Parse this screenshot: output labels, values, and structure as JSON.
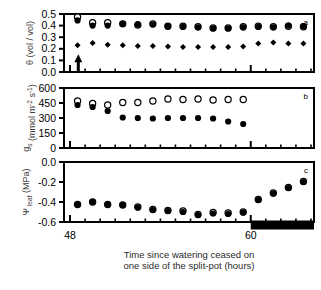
{
  "figure": {
    "panels": [
      "a",
      "b",
      "c"
    ],
    "x_axis": {
      "label_line1": "Time since watering ceased on",
      "label_line2": "one side of the split-pot (hours)",
      "ticks": [
        48,
        60
      ],
      "tick_labels": [
        "48",
        "60"
      ],
      "range": [
        47.6,
        64.2
      ],
      "minor_tick_step": 1
    }
  },
  "panel_a": {
    "letter": "a",
    "y_label": "θ (vol / vol)",
    "y_ticks": [
      0.0,
      0.1,
      0.2,
      0.3,
      0.4,
      0.5
    ],
    "y_tick_labels": [
      "0.0",
      "0.1",
      "0.2",
      "0.3",
      "0.4",
      "0.5"
    ],
    "ylim": [
      0.0,
      0.5
    ],
    "arrow": {
      "x": 48.55,
      "y_from": 0.0,
      "y_to": 0.135,
      "name": "watering-ceased-arrow"
    }
  },
  "panel_b": {
    "letter": "b",
    "y_label": "g_s (mmol m-2 s-1)",
    "y_ticks": [
      0,
      150,
      300,
      450,
      600
    ],
    "y_tick_labels": [
      "0",
      "150",
      "300",
      "450",
      "600"
    ],
    "ylim": [
      0,
      600
    ]
  },
  "panel_c": {
    "letter": "c",
    "y_label": "Ψ leaf (MPa)",
    "y_ticks": [
      -0.6,
      -0.4,
      -0.2,
      0.0
    ],
    "y_tick_labels": [
      "-0.6",
      "-0.4",
      "-0.2",
      "0.0"
    ],
    "ylim": [
      -0.6,
      0.0
    ],
    "dark_bar": {
      "x_start": 60.0,
      "x_end": 64.2,
      "label": "night-period-bar"
    }
  },
  "chart_data": [
    {
      "type": "scatter",
      "panel": "a",
      "title": "",
      "xlabel": "Time since watering ceased on one side of the split-pot (hours)",
      "ylabel": "θ (vol / vol)",
      "xlim": [
        47.6,
        64.2
      ],
      "ylim": [
        0.0,
        0.5
      ],
      "grid": false,
      "legend": "none",
      "x": [
        48.5,
        49.5,
        50.5,
        51.5,
        52.5,
        53.5,
        54.5,
        55.5,
        56.5,
        57.5,
        58.5,
        59.5,
        60.5,
        61.5,
        62.5,
        63.5
      ],
      "series": [
        {
          "name": "wet side (open circle)",
          "marker": "open-circle",
          "values": [
            0.475,
            0.425,
            0.425,
            0.415,
            0.405,
            0.415,
            0.395,
            0.395,
            0.39,
            0.38,
            0.38,
            0.39,
            0.395,
            0.39,
            0.395,
            0.39
          ]
        },
        {
          "name": "bulk / mean (filled circle)",
          "marker": "filled-circle",
          "values": [
            0.445,
            0.4,
            0.4,
            0.415,
            0.41,
            0.41,
            0.395,
            0.39,
            0.385,
            0.375,
            0.375,
            0.385,
            0.39,
            0.385,
            0.4,
            0.395
          ]
        },
        {
          "name": "dry side (filled diamond)",
          "marker": "filled-diamond",
          "values": [
            0.23,
            0.25,
            0.235,
            0.23,
            0.225,
            0.225,
            0.22,
            0.215,
            0.215,
            0.215,
            0.215,
            0.22,
            0.245,
            0.255,
            0.245,
            0.245
          ]
        }
      ]
    },
    {
      "type": "scatter",
      "panel": "b",
      "title": "",
      "xlabel": "Time since watering ceased on one side of the split-pot (hours)",
      "ylabel": "g_s (mmol m-2 s-1)",
      "xlim": [
        47.6,
        64.2
      ],
      "ylim": [
        0,
        600
      ],
      "grid": false,
      "legend": "none",
      "x": [
        48.5,
        49.5,
        50.5,
        51.5,
        52.5,
        53.5,
        54.5,
        55.5,
        56.5,
        57.5,
        58.5,
        59.5
      ],
      "series": [
        {
          "name": "control (open circle)",
          "marker": "open-circle",
          "values": [
            470,
            445,
            430,
            455,
            455,
            470,
            490,
            485,
            490,
            480,
            485,
            485
          ]
        },
        {
          "name": "split-pot dried (filled circle)",
          "marker": "filled-circle",
          "values": [
            430,
            410,
            370,
            305,
            300,
            295,
            300,
            300,
            300,
            295,
            265,
            240
          ]
        }
      ]
    },
    {
      "type": "scatter",
      "panel": "c",
      "title": "",
      "xlabel": "Time since watering ceased on one side of the split-pot (hours)",
      "ylabel": "Ψ leaf (MPa)",
      "xlim": [
        47.6,
        64.2
      ],
      "ylim": [
        -0.6,
        0.0
      ],
      "grid": false,
      "legend": "none",
      "x": [
        48.5,
        49.5,
        50.5,
        51.5,
        52.5,
        53.5,
        54.5,
        55.5,
        56.5,
        57.5,
        58.5,
        59.5,
        60.5,
        61.5,
        62.5,
        63.5
      ],
      "series": [
        {
          "name": "control (open circle)",
          "marker": "open-circle",
          "values": [
            -0.425,
            -0.4,
            -0.425,
            -0.43,
            -0.45,
            -0.475,
            -0.485,
            -0.49,
            -0.525,
            -0.505,
            -0.51,
            -0.5,
            -0.375,
            -0.31,
            -0.255,
            -0.195
          ]
        },
        {
          "name": "split-pot dried (filled circle)",
          "marker": "filled-circle",
          "values": [
            -0.425,
            -0.4,
            -0.425,
            -0.43,
            -0.455,
            -0.48,
            -0.49,
            -0.5,
            -0.53,
            -0.515,
            -0.52,
            -0.505,
            -0.38,
            -0.315,
            -0.26,
            -0.2
          ]
        }
      ]
    }
  ]
}
